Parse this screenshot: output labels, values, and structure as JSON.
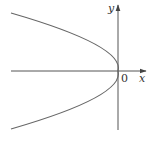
{
  "diagram": {
    "type": "parabola-graph",
    "labels": {
      "x_axis": "x",
      "y_axis": "y",
      "origin": "0"
    },
    "colors": {
      "axis": "#555555",
      "curve": "#666666",
      "text": "#333333",
      "background": "#ffffff"
    },
    "curve": {
      "vertex": [
        0,
        0
      ],
      "opens": "left"
    }
  }
}
